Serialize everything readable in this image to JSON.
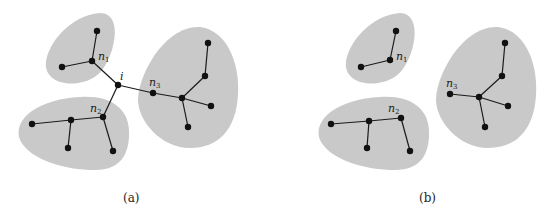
{
  "colors": {
    "blob": "#c9c9c9",
    "node": "#111111",
    "edge": "#1a1a1a",
    "background": "#ffffff"
  },
  "panels": [
    {
      "caption": "(a)",
      "labels": {
        "i": "i",
        "n1": "n",
        "n1_sub": "1",
        "n2": "n",
        "n2_sub": "2",
        "n3": "n",
        "n3_sub": "3"
      }
    },
    {
      "caption": "(b)",
      "labels": {
        "n1": "n",
        "n1_sub": "1",
        "n2": "n",
        "n2_sub": "2",
        "n3": "n",
        "n3_sub": "3"
      }
    }
  ]
}
